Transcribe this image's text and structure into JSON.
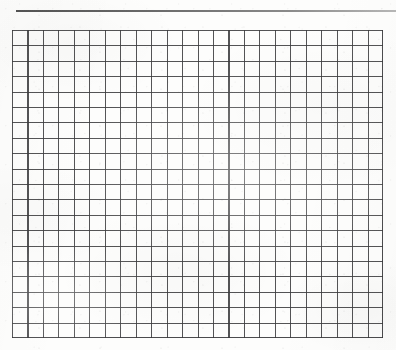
{
  "document": {
    "kind": "scanned-grid-paper",
    "description": "Blank sheet of graph paper with a horizontal rule near the top",
    "background_color": "#fdfdfc",
    "canvas": {
      "width": 396,
      "height": 350
    }
  },
  "top_rule": {
    "name": "horizontal-rule",
    "color": "#4a4a4a",
    "x": 16,
    "y": 10,
    "width": 380,
    "height": 2
  },
  "grid": {
    "name": "graph-paper-grid",
    "line_color": "#3c3c3e",
    "cell_fill": "#fdfdfc",
    "columns": 24,
    "rows": 20,
    "cell_width": 15.46,
    "cell_height": 15.4,
    "x": 12,
    "y": 30,
    "width": 371,
    "height": 308,
    "line_width": 1.1
  },
  "annotations": {
    "text_content": [],
    "marks": []
  }
}
